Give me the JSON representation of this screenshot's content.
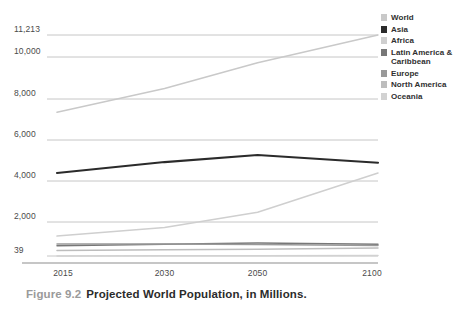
{
  "caption": {
    "figure_number": "Figure 9.2",
    "title": "Projected World Population, in Millions."
  },
  "chart_data": {
    "type": "line",
    "title": "Projected World Population, in Millions.",
    "xlabel": "",
    "ylabel": "",
    "x": [
      "2015",
      "2030",
      "2050",
      "2100"
    ],
    "categories": [
      "2015",
      "2030",
      "2050",
      "2100"
    ],
    "ylim": [
      39,
      11213
    ],
    "yticks": [
      "39",
      "2,000",
      "4,000",
      "6,000",
      "8,000",
      "10,000",
      "11,213"
    ],
    "ytick_values": [
      39,
      2000,
      4000,
      6000,
      8000,
      10000,
      11213
    ],
    "grid": true,
    "legend_position": "right",
    "series": [
      {
        "name": "World",
        "color": "#c9c9c9",
        "values": [
          7349,
          8501,
          9725,
          11213
        ]
      },
      {
        "name": "Asia",
        "color": "#2b2b2b",
        "values": [
          4393,
          4923,
          5267,
          4889
        ]
      },
      {
        "name": "Africa",
        "color": "#cfcfcf",
        "values": [
          1186,
          1679,
          2478,
          4387
        ]
      },
      {
        "name": "Latin America &\nCaribbean",
        "color": "#777777",
        "values": [
          634,
          721,
          784,
          721
        ]
      },
      {
        "name": "Europe",
        "color": "#999999",
        "values": [
          738,
          734,
          707,
          646
        ]
      },
      {
        "name": "North America",
        "color": "#bdbdbd",
        "values": [
          358,
          396,
          433,
          500
        ]
      },
      {
        "name": "Oceania",
        "color": "#d2d2d2",
        "values": [
          39,
          47,
          57,
          71
        ]
      }
    ]
  }
}
